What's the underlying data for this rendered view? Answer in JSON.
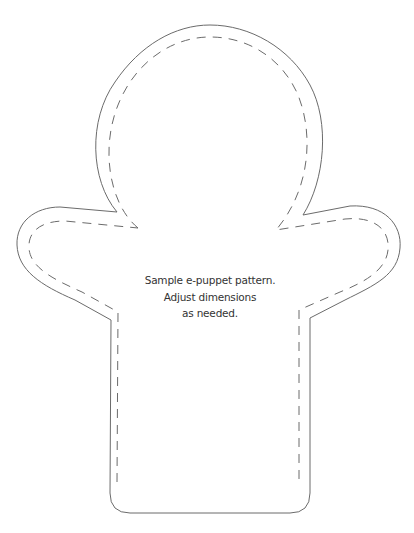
{
  "pattern": {
    "name": "e-puppet pattern",
    "caption_lines": [
      "Sample e-puppet pattern.",
      "Adjust dimensions",
      "as needed."
    ],
    "colors": {
      "background": "#ffffff",
      "cut_line": "#6b6b6b",
      "stitch_line": "#6b6b6b",
      "text": "#333333"
    },
    "lines": {
      "cut_line": "solid",
      "stitch_line": "dashed"
    }
  }
}
